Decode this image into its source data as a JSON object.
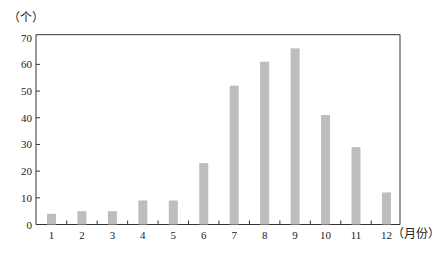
{
  "chart_data": {
    "type": "bar",
    "title": "",
    "ylabel": "（个）",
    "xlabel": "（月份）",
    "categories": [
      "1",
      "2",
      "3",
      "4",
      "5",
      "6",
      "7",
      "8",
      "9",
      "10",
      "11",
      "12"
    ],
    "values": [
      4,
      5,
      5,
      9,
      9,
      23,
      52,
      61,
      66,
      41,
      29,
      12
    ],
    "ylim": [
      0,
      70
    ],
    "yticks": [
      0,
      10,
      20,
      30,
      40,
      50,
      60,
      70
    ],
    "grid": false,
    "legend": null,
    "bar_color": "#bdbdbd",
    "axis_color": "#333333"
  }
}
